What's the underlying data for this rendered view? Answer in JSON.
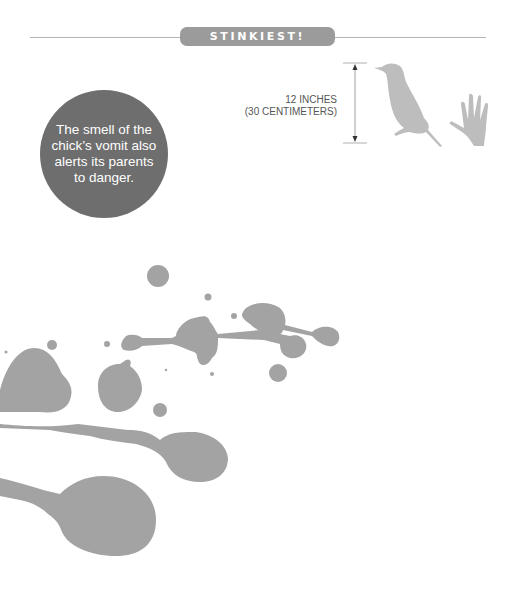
{
  "header": {
    "badge_label": "STINKIEST!"
  },
  "fact_bubble": {
    "text": "The smell of the chick’s vomit also alerts its parents to danger."
  },
  "scale": {
    "line1": "12 INCHES",
    "line2": "(30 CENTIMETERS)",
    "icons": [
      "bird-silhouette-icon",
      "hand-silhouette-icon"
    ]
  },
  "colors": {
    "badge": "#9b9b9b",
    "bubble": "#6e6e6e",
    "silhouette": "#bdbdbd",
    "splatter": "#a3a3a3",
    "rule": "#b3b3b3"
  }
}
